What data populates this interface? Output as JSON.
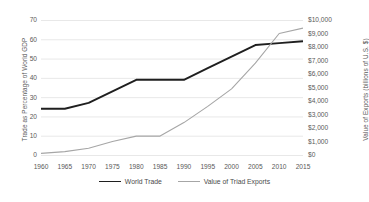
{
  "chart_data": {
    "type": "line",
    "title": "",
    "subtitle": "",
    "xlabel": "",
    "ylabel": "Trade as Percentage of World GDP",
    "y2label": "Value of Exports (billions of U.S. $)",
    "grid": true,
    "legend_position": "bottom-center",
    "x": [
      1960,
      1965,
      1970,
      1975,
      1980,
      1985,
      1990,
      1995,
      2000,
      2005,
      2010,
      2015
    ],
    "xtick_labels": [
      "1960",
      "1965",
      "1970",
      "1975",
      "1980",
      "1985",
      "1990",
      "1995",
      "2000",
      "2005",
      "2010",
      "2015"
    ],
    "xlim": [
      1960,
      2015
    ],
    "ylim": [
      0,
      70
    ],
    "ytick_labels": [
      "0",
      "10",
      "20",
      "30",
      "40",
      "50",
      "60",
      "70"
    ],
    "ytick_values": [
      0,
      10,
      20,
      30,
      40,
      50,
      60,
      70
    ],
    "y2lim": [
      0,
      10000
    ],
    "y2tick_labels": [
      "$0",
      "$1,000",
      "$2,000",
      "$3,000",
      "$4,000",
      "$5,000",
      "$6,000",
      "$7,000",
      "$8,000",
      "$9,000",
      "$10,000"
    ],
    "y2tick_values": [
      0,
      1000,
      2000,
      3000,
      4000,
      5000,
      6000,
      7000,
      8000,
      9000,
      10000
    ],
    "series": [
      {
        "name": "World Trade",
        "axis": "left",
        "color": "#1f1f1f",
        "width": 1.9,
        "values": [
          24,
          24,
          27,
          33,
          39,
          39,
          39,
          45,
          51,
          57,
          58,
          59
        ]
      },
      {
        "name": "Value of Triad Exports",
        "axis": "right",
        "color": "#a6a6a6",
        "width": 1.1,
        "values": [
          120,
          250,
          500,
          1000,
          1400,
          1400,
          2400,
          3600,
          4900,
          6800,
          9000,
          9400
        ]
      }
    ]
  },
  "legend": {
    "entries": [
      {
        "label": "World Trade"
      },
      {
        "label": "Value of Triad Exports"
      }
    ]
  },
  "colors": {
    "series_a": "#1f1f1f",
    "series_b": "#a6a6a6",
    "grid": "#e8e8e8",
    "text": "#4a4a4a",
    "background": "#ffffff"
  }
}
